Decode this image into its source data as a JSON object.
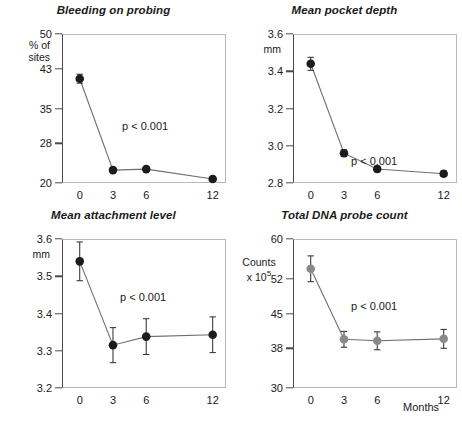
{
  "figure": {
    "panels": [
      "bleeding",
      "pocket",
      "attachment",
      "dna"
    ],
    "xlabel": "Months",
    "marker_color_dark": "#1c1c1c",
    "marker_color_gray": "#8a8a8a",
    "line_color": "#6e6e6e"
  },
  "chart_data": [
    {
      "type": "line",
      "title": "Bleeding on probing",
      "ylabel": "% of\nsites",
      "xlabel": "",
      "x": [
        0,
        3,
        6,
        12
      ],
      "xtick_labels": [
        "0",
        "3",
        "6",
        "12"
      ],
      "values": [
        41.0,
        22.6,
        22.8,
        20.8
      ],
      "errors": [
        0.9,
        0.5,
        0.5,
        0.5
      ],
      "ytick_values": [
        20,
        28,
        35,
        43,
        50
      ],
      "ytick_labels": [
        "20",
        "28",
        "35",
        "43",
        "50"
      ],
      "ylim": [
        20,
        50
      ],
      "xlim": [
        -1.6,
        13.2
      ],
      "annotation": "p < 0.001",
      "marker_color": "#1c1c1c",
      "grid": false,
      "legend": "none"
    },
    {
      "type": "line",
      "title": "Mean pocket depth",
      "ylabel": "mm",
      "xlabel": "",
      "x": [
        0,
        3,
        6,
        12
      ],
      "xtick_labels": [
        "0",
        "3",
        "6",
        "12"
      ],
      "values": [
        3.44,
        2.96,
        2.875,
        2.85
      ],
      "errors": [
        0.035,
        0.018,
        0.015,
        0.015
      ],
      "ytick_values": [
        2.8,
        3.0,
        3.2,
        3.4,
        3.6
      ],
      "ytick_labels": [
        "2.8",
        "3.0",
        "3.2",
        "3.4",
        "3.6"
      ],
      "ylim": [
        2.8,
        3.6
      ],
      "xlim": [
        -1.6,
        13.2
      ],
      "annotation": "p < 0.001",
      "marker_color": "#1c1c1c",
      "grid": false,
      "legend": "none"
    },
    {
      "type": "line",
      "title": "Mean attachment level",
      "ylabel": "mm",
      "xlabel": "",
      "x": [
        0,
        3,
        6,
        12
      ],
      "xtick_labels": [
        "0",
        "3",
        "6",
        "12"
      ],
      "values": [
        3.54,
        3.315,
        3.338,
        3.343
      ],
      "errors": [
        0.052,
        0.047,
        0.048,
        0.048
      ],
      "ytick_values": [
        3.2,
        3.3,
        3.4,
        3.5,
        3.6
      ],
      "ytick_labels": [
        "3.2",
        "3.3",
        "3.4",
        "3.5",
        "3.6"
      ],
      "ylim": [
        3.2,
        3.6
      ],
      "xlim": [
        -1.6,
        13.2
      ],
      "annotation": "p < 0.001",
      "marker_color": "#1c1c1c",
      "grid": false,
      "legend": "none"
    },
    {
      "type": "line",
      "title": "Total DNA probe count",
      "ylabel": "Counts\nx 10",
      "ylabel_exponent": "5",
      "xlabel": "Months",
      "x": [
        0,
        3,
        6,
        12
      ],
      "xtick_labels": [
        "0",
        "3",
        "6",
        "12"
      ],
      "values": [
        54.0,
        39.8,
        39.5,
        39.9
      ],
      "errors": [
        2.6,
        1.6,
        1.8,
        1.9
      ],
      "ytick_values": [
        30,
        38,
        45,
        52,
        60
      ],
      "ytick_labels": [
        "30",
        "38",
        "45",
        "52",
        "60"
      ],
      "ylim": [
        30,
        60
      ],
      "xlim": [
        -1.6,
        13.2
      ],
      "annotation": "p < 0.001",
      "marker_color": "#8a8a8a",
      "grid": false,
      "legend": "none"
    }
  ]
}
